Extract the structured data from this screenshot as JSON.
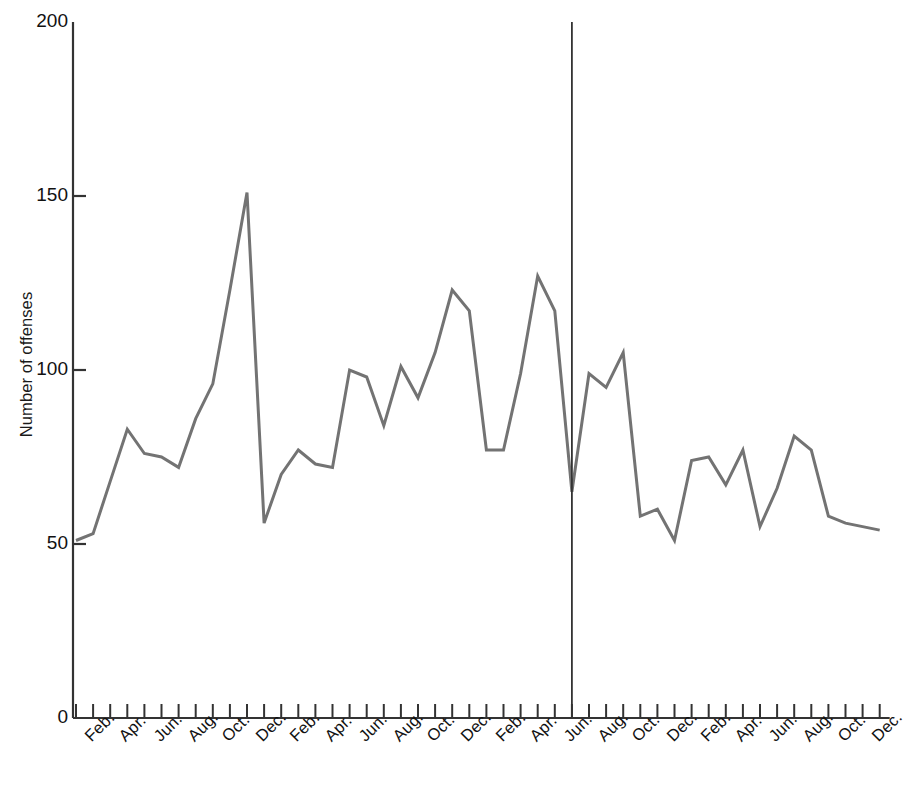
{
  "chart_data": {
    "type": "line",
    "title": "",
    "xlabel": "",
    "ylabel": "Number of offenses",
    "ylim": [
      0,
      200
    ],
    "yticks": [
      0,
      50,
      100,
      150,
      200
    ],
    "ytick_labels": [
      "0",
      "50",
      "100",
      "150",
      "200"
    ],
    "grid": false,
    "legend": "none",
    "line_color": "#737373",
    "axis_color": "#333333",
    "x_tick_count": 48,
    "x_tick_labels_every": 2,
    "x": [
      "Jan.",
      "Feb.",
      "Mar.",
      "Apr.",
      "May",
      "Jun.",
      "Jul.",
      "Aug.",
      "Sep.",
      "Oct.",
      "Nov.",
      "Dec.",
      "Jan.",
      "Feb.",
      "Mar.",
      "Apr.",
      "May",
      "Jun.",
      "Jul.",
      "Aug.",
      "Sep.",
      "Oct.",
      "Nov.",
      "Dec.",
      "Jan.",
      "Feb.",
      "Mar.",
      "Apr.",
      "May",
      "Jun.",
      "Jul.",
      "Aug.",
      "Sep.",
      "Oct.",
      "Nov.",
      "Dec.",
      "Jan.",
      "Feb.",
      "Mar.",
      "Apr.",
      "May",
      "Jun.",
      "Jul.",
      "Aug.",
      "Sep.",
      "Oct.",
      "Nov.",
      "Dec."
    ],
    "visible_tick_labels": [
      {
        "index": 1,
        "label": "Feb."
      },
      {
        "index": 3,
        "label": "Apr."
      },
      {
        "index": 5,
        "label": "Jun."
      },
      {
        "index": 7,
        "label": "Aug."
      },
      {
        "index": 9,
        "label": "Oct."
      },
      {
        "index": 11,
        "label": "Dec."
      },
      {
        "index": 13,
        "label": "Feb."
      },
      {
        "index": 15,
        "label": "Apr."
      },
      {
        "index": 17,
        "label": "Jun."
      },
      {
        "index": 19,
        "label": "Aug."
      },
      {
        "index": 21,
        "label": "Oct."
      },
      {
        "index": 23,
        "label": "Dec."
      },
      {
        "index": 25,
        "label": "Feb."
      },
      {
        "index": 27,
        "label": "Apr."
      },
      {
        "index": 29,
        "label": "Jun."
      },
      {
        "index": 31,
        "label": "Aug."
      },
      {
        "index": 33,
        "label": "Oct."
      },
      {
        "index": 35,
        "label": "Dec."
      },
      {
        "index": 37,
        "label": "Feb."
      },
      {
        "index": 39,
        "label": "Apr."
      },
      {
        "index": 41,
        "label": "Jun."
      },
      {
        "index": 43,
        "label": "Aug."
      },
      {
        "index": 45,
        "label": "Oct."
      },
      {
        "index": 47,
        "label": "Dec."
      }
    ],
    "values": [
      51,
      53,
      68,
      83,
      76,
      75,
      72,
      86,
      96,
      123,
      151,
      56,
      70,
      77,
      73,
      72,
      100,
      98,
      84,
      101,
      92,
      105,
      123,
      117,
      77,
      77,
      99,
      127,
      117,
      65,
      99,
      95,
      105,
      58,
      60,
      51,
      74,
      75,
      67,
      77,
      55,
      66,
      81,
      77,
      58,
      56,
      55,
      54
    ],
    "annotations": [
      {
        "type": "vline",
        "at_index": 29,
        "label": "",
        "color": "#333333"
      }
    ]
  }
}
